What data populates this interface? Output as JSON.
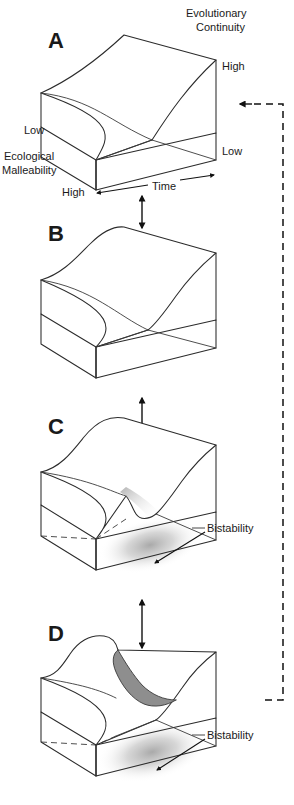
{
  "figure": {
    "width": 294,
    "height": 805,
    "background": "#ffffff",
    "line_color": "#2b2b2b",
    "fold_fill": "#8e8e8e",
    "shadow_color": "#b4b4b4"
  },
  "axes": {
    "depth_axis_label": "Evolutionary\nContinuity",
    "depth_axis_label_line1": "Evolutionary",
    "depth_axis_label_line2": "Continuity",
    "depth_high": "High",
    "depth_low": "Low",
    "vertical_axis_label_line1": "Ecological",
    "vertical_axis_label_line2": "Malleability",
    "vertical_low": "Low",
    "vertical_high": "High",
    "horizontal_axis_label": "Time"
  },
  "panels": [
    {
      "id": "A",
      "letter": "A",
      "state": "single smooth surface, no fold",
      "annotations": []
    },
    {
      "id": "B",
      "letter": "B",
      "state": "surface steepening, incipient fold",
      "annotations": []
    },
    {
      "id": "C",
      "letter": "C",
      "state": "fold forming, bistable region appears",
      "annotations": [
        "Bistability"
      ]
    },
    {
      "id": "D",
      "letter": "D",
      "state": "fully developed overhanging cusp fold",
      "annotations": [
        "Bistability"
      ]
    }
  ],
  "annotations": {
    "bistability_label": "Bistability"
  },
  "connectors": {
    "transition_arrow_name": "double-headed vertical arrow",
    "feedback_arrow_name": "dashed feedback loop from D back to A",
    "feedback_arrow_style": "dashed"
  }
}
